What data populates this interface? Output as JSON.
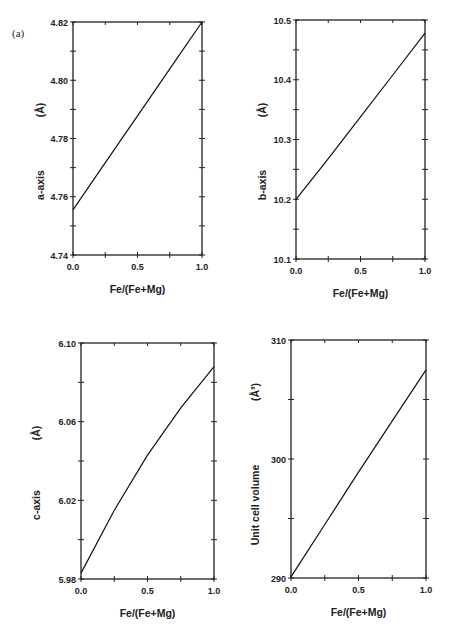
{
  "figure": {
    "panel_label": "(a)"
  },
  "chart_data": [
    {
      "type": "line",
      "title": "",
      "xlabel": "Fe/(Fe+Mg)",
      "ylabel": "a-axis",
      "ylabel_unit": "(Å)",
      "xlim": [
        0.0,
        1.0
      ],
      "ylim": [
        4.74,
        4.82
      ],
      "x_ticks": [
        "0.0",
        "0.5",
        "1.0"
      ],
      "y_ticks": [
        "4.74",
        "4.76",
        "4.78",
        "4.80",
        "4.82"
      ],
      "grid": false,
      "series": [
        {
          "name": "a-axis",
          "x": [
            0.0,
            0.25,
            0.5,
            0.75,
            1.0
          ],
          "values": [
            4.7555,
            4.7717,
            4.7878,
            4.8039,
            4.82
          ]
        }
      ]
    },
    {
      "type": "line",
      "title": "",
      "xlabel": "Fe/(Fe+Mg)",
      "ylabel": "b-axis",
      "ylabel_unit": "(Å)",
      "xlim": [
        0.0,
        1.0
      ],
      "ylim": [
        10.1,
        10.5
      ],
      "x_ticks": [
        "0.0",
        "0.5",
        "1.0"
      ],
      "y_ticks": [
        "10.1",
        "10.2",
        "10.3",
        "10.4",
        "10.5"
      ],
      "grid": false,
      "series": [
        {
          "name": "b-axis",
          "x": [
            0.0,
            0.25,
            0.5,
            0.75,
            1.0
          ],
          "values": [
            10.2,
            10.268,
            10.338,
            10.408,
            10.478
          ]
        }
      ]
    },
    {
      "type": "line",
      "title": "",
      "xlabel": "Fe/(Fe+Mg)",
      "ylabel": "c-axis",
      "ylabel_unit": "(Å)",
      "xlim": [
        0.0,
        1.0
      ],
      "ylim": [
        5.98,
        6.1
      ],
      "x_ticks": [
        "0.0",
        "0.5",
        "1.0"
      ],
      "y_ticks": [
        "5.98",
        "6.02",
        "6.06",
        "6.10"
      ],
      "grid": false,
      "series": [
        {
          "name": "c-axis",
          "x": [
            0.0,
            0.25,
            0.5,
            0.75,
            1.0
          ],
          "values": [
            5.983,
            6.015,
            6.043,
            6.067,
            6.088
          ]
        }
      ]
    },
    {
      "type": "line",
      "title": "",
      "xlabel": "Fe/(Fe+Mg)",
      "ylabel": "Unit cell volume",
      "ylabel_unit": "(Å³)",
      "xlim": [
        0.0,
        1.0
      ],
      "ylim": [
        290,
        310
      ],
      "x_ticks": [
        "0.0",
        "0.5",
        "1.0"
      ],
      "y_ticks": [
        "290",
        "300",
        "310"
      ],
      "grid": false,
      "series": [
        {
          "name": "Unit cell volume",
          "x": [
            0.0,
            0.25,
            0.5,
            0.75,
            1.0
          ],
          "values": [
            290.1,
            294.5,
            298.9,
            303.2,
            307.5
          ]
        }
      ]
    }
  ]
}
